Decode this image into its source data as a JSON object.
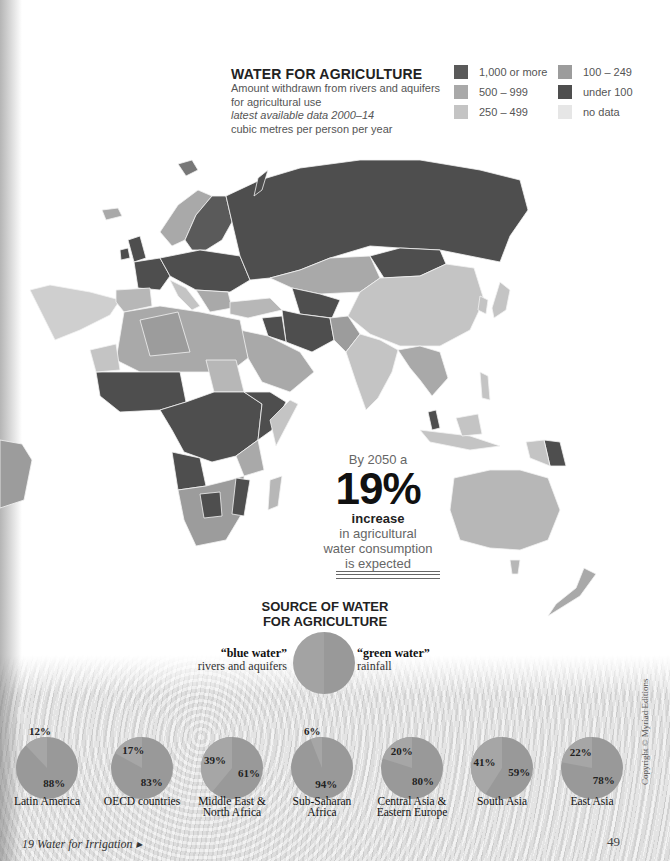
{
  "header": {
    "title": "WATER FOR AGRICULTURE",
    "subtitle_lines": [
      "Amount withdrawn from rivers and aquifers",
      "for agricultural use"
    ],
    "data_note": "latest available data 2000–14",
    "units": "cubic metres per person per year"
  },
  "legend": {
    "items": [
      {
        "label": "1,000 or more",
        "color": "#5a5a5a"
      },
      {
        "label": "500 – 999",
        "color": "#a9a9a9"
      },
      {
        "label": "250 – 499",
        "color": "#c4c4c4"
      },
      {
        "label": "100 – 249",
        "color": "#9c9c9c"
      },
      {
        "label": "under 100",
        "color": "#4e4e4e"
      },
      {
        "label": "no data",
        "color": "#e6e6e6"
      }
    ]
  },
  "callout": {
    "intro": "By 2050 a",
    "figure": "19%",
    "bold": "increase",
    "lines": [
      "in agricultural",
      "water consumption",
      "is expected"
    ]
  },
  "source": {
    "title_lines": [
      "SOURCE OF WATER",
      "FOR AGRICULTURE"
    ],
    "blue_label": "“blue water”",
    "blue_desc": "rivers and aquifers",
    "green_label": "“green water”",
    "green_desc": "rainfall"
  },
  "footer": {
    "section": "19 Water for Irrigation ▸",
    "page_number": "49",
    "copyright": "Copyright © Myriad Editions"
  },
  "chart_data": [
    {
      "type": "pie",
      "title": "SOURCE OF WATER FOR AGRICULTURE",
      "categories": [
        "blue water (rivers and aquifers)",
        "green water (rainfall)"
      ],
      "series": [
        {
          "name": "Latin America",
          "values": [
            12,
            88
          ]
        },
        {
          "name": "OECD countries",
          "values": [
            17,
            83
          ]
        },
        {
          "name": "Middle East & North Africa",
          "values": [
            39,
            61
          ]
        },
        {
          "name": "Sub-Saharan Africa",
          "values": [
            6,
            94
          ]
        },
        {
          "name": "Central Asia & Eastern Europe",
          "values": [
            20,
            80
          ]
        },
        {
          "name": "South Asia",
          "values": [
            41,
            59
          ]
        },
        {
          "name": "East Asia",
          "values": [
            22,
            78
          ]
        }
      ],
      "unit": "%"
    },
    {
      "type": "heatmap",
      "title": "WATER FOR AGRICULTURE",
      "subtitle": "Amount withdrawn from rivers and aquifers for agricultural use, cubic metres per person per year, latest available data 2000–14",
      "legend": [
        "1,000 or more",
        "500 – 999",
        "250 – 499",
        "100 – 249",
        "under 100",
        "no data"
      ]
    }
  ],
  "pies": [
    {
      "name_lines": [
        "Latin America"
      ],
      "blue": "12%",
      "green": "88%"
    },
    {
      "name_lines": [
        "OECD countries"
      ],
      "blue": "17%",
      "green": "83%"
    },
    {
      "name_lines": [
        "Middle East &",
        "North Africa"
      ],
      "blue": "39%",
      "green": "61%"
    },
    {
      "name_lines": [
        "Sub-Saharan",
        "Africa"
      ],
      "blue": "6%",
      "green": "94%"
    },
    {
      "name_lines": [
        "Central Asia &",
        "Eastern Europe"
      ],
      "blue": "20%",
      "green": "80%"
    },
    {
      "name_lines": [
        "South Asia"
      ],
      "blue": "41%",
      "green": "59%"
    },
    {
      "name_lines": [
        "East Asia"
      ],
      "blue": "22%",
      "green": "78%"
    }
  ]
}
